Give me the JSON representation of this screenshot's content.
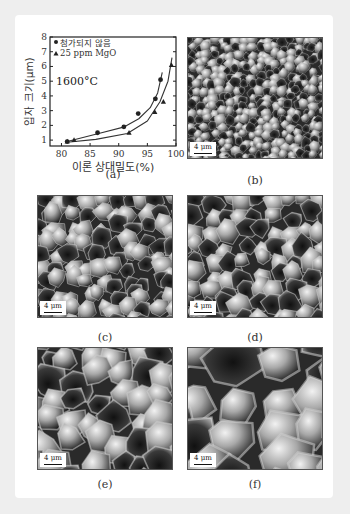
{
  "figure": {
    "panels": [
      {
        "id": "a",
        "caption": "(a)"
      },
      {
        "id": "b",
        "caption": "(b)",
        "scale_label": "4 μm"
      },
      {
        "id": "c",
        "caption": "(c)",
        "scale_label": "4 μm"
      },
      {
        "id": "d",
        "caption": "(d)",
        "scale_label": "4 μm"
      },
      {
        "id": "e",
        "caption": "(e)",
        "scale_label": "4 μm"
      },
      {
        "id": "f",
        "caption": "(f)",
        "scale_label": "4 μm"
      }
    ]
  },
  "chart_data": {
    "type": "scatter",
    "title": "",
    "annotation": "1600°C",
    "xlabel": "이론 상대밀도(%)",
    "ylabel": "입자 크기(μm)",
    "xlim": [
      78,
      100
    ],
    "ylim": [
      0.6,
      8
    ],
    "xticks": [
      80,
      85,
      90,
      95,
      100
    ],
    "yticks": [
      1,
      2,
      3,
      4,
      5,
      6,
      7,
      8
    ],
    "grid": false,
    "legend_position": "upper left",
    "series": [
      {
        "name": "첨가되지 않음",
        "marker": "circle",
        "x": [
          81.0,
          86.3,
          90.9,
          93.4,
          96.4,
          97.3
        ],
        "y": [
          0.9,
          1.5,
          1.9,
          2.8,
          3.8,
          5.1
        ]
      },
      {
        "name": "25 ppm MgO",
        "marker": "triangle",
        "x": [
          81.0,
          82.2,
          91.8,
          96.3,
          97.8,
          99.2
        ],
        "y": [
          0.9,
          1.0,
          1.5,
          2.9,
          3.6,
          6.1
        ]
      }
    ]
  }
}
